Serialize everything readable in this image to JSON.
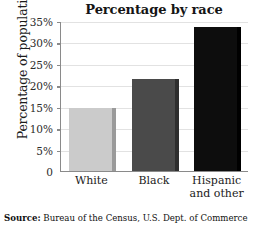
{
  "chart_data": {
    "type": "bar",
    "title": "Percentage by race",
    "xlabel": "",
    "ylabel": "Percentage of population",
    "categories": [
      "White",
      "Black",
      "Hispanic and other"
    ],
    "category_lines": [
      [
        "White"
      ],
      [
        "Black"
      ],
      [
        "Hispanic",
        "and other"
      ]
    ],
    "values": [
      14.8,
      21.5,
      33.5
    ],
    "ylim": [
      0,
      35
    ],
    "ytick_values": [
      0,
      5,
      10,
      15,
      20,
      25,
      30,
      35
    ],
    "ytick_labels": [
      "0",
      "5%",
      "10%",
      "15%",
      "20%",
      "25%",
      "30%",
      "35%"
    ],
    "grid": true,
    "legend": false,
    "bar_colors": [
      "#cbcbcb",
      "#4a4a4a",
      "#0d0d0d"
    ],
    "bar_side_colors": [
      "#9a9a9a",
      "#2e2e2e",
      "#000000"
    ]
  },
  "footer": {
    "source_label": "Source:",
    "source_text": "Bureau of the Census, U.S. Dept. of Commerce"
  },
  "colors": {
    "axis": "#8a8a8a",
    "grid": "#e2e2e2",
    "text": "#1b1b1b",
    "background": "#ffffff"
  }
}
